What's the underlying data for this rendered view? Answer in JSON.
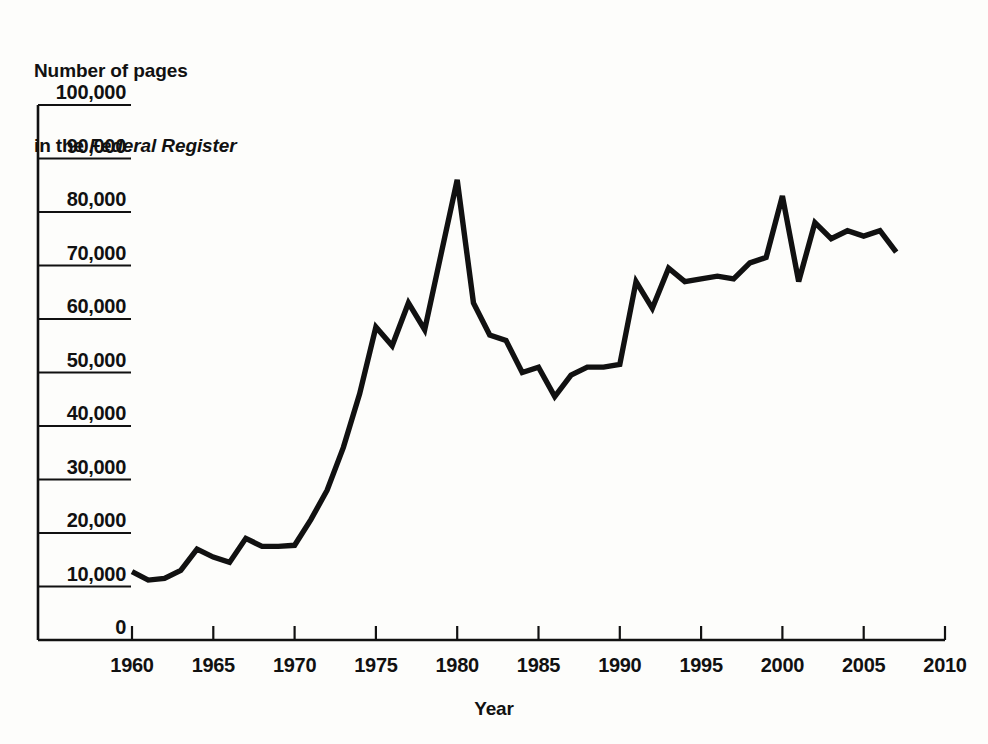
{
  "figure": {
    "title_line1": "Number of pages",
    "title_line2_prefix": "in the ",
    "title_line2_italic": "Federal Register",
    "background_color": "#fdfdfb",
    "line_color": "#111111",
    "axis_color": "#111111"
  },
  "chart_data": {
    "type": "line",
    "title": "Number of pages in the Federal Register",
    "xlabel": "Year",
    "ylabel": "Number of pages in the Federal Register",
    "xlim": [
      1960,
      2010
    ],
    "ylim": [
      0,
      100000
    ],
    "grid": false,
    "legend": "none",
    "xticks": [
      1960,
      1965,
      1970,
      1975,
      1980,
      1985,
      1990,
      1995,
      2000,
      2005,
      2010
    ],
    "xtick_labels": [
      "1960",
      "1965",
      "1970",
      "1975",
      "1980",
      "1985",
      "1990",
      "1995",
      "2000",
      "2005",
      "2010"
    ],
    "yticks": [
      0,
      10000,
      20000,
      30000,
      40000,
      50000,
      60000,
      70000,
      80000,
      90000,
      100000
    ],
    "ytick_labels": [
      "0",
      "10,000",
      "20,000",
      "30,000",
      "40,000",
      "50,000",
      "60,000",
      "70,000",
      "80,000",
      "90,000",
      "100,000"
    ],
    "series": [
      {
        "name": "Pages in the Federal Register",
        "x": [
          1960,
          1961,
          1962,
          1963,
          1964,
          1965,
          1966,
          1967,
          1968,
          1969,
          1970,
          1971,
          1972,
          1973,
          1974,
          1975,
          1976,
          1977,
          1978,
          1979,
          1980,
          1981,
          1982,
          1983,
          1984,
          1985,
          1986,
          1987,
          1988,
          1989,
          1990,
          1991,
          1992,
          1993,
          1994,
          1995,
          1996,
          1997,
          1998,
          1999,
          2000,
          2001,
          2002,
          2003,
          2004,
          2005,
          2006,
          2007
        ],
        "values": [
          12800,
          11200,
          11500,
          13000,
          17000,
          15500,
          14500,
          19000,
          17500,
          17500,
          17700,
          22500,
          28000,
          36000,
          46000,
          58500,
          55000,
          63000,
          58000,
          72000,
          86000,
          63000,
          57000,
          56000,
          50000,
          51000,
          45500,
          49500,
          51000,
          51000,
          51500,
          67000,
          62000,
          69500,
          67000,
          67500,
          68000,
          67500,
          70500,
          71500,
          83000,
          67000,
          78000,
          75000,
          76500,
          75500,
          76500,
          72500
        ]
      }
    ],
    "annotations": []
  },
  "axis_title_x": "Year"
}
